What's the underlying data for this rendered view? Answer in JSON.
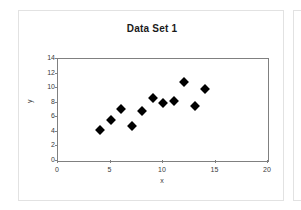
{
  "chart_data": {
    "type": "scatter",
    "title": "Data Set 1",
    "xlabel": "x",
    "ylabel": "y",
    "xlim": [
      0,
      20
    ],
    "ylim": [
      0,
      14
    ],
    "xticks": [
      0,
      5,
      10,
      15,
      20
    ],
    "yticks": [
      0,
      2,
      4,
      6,
      8,
      10,
      12,
      14
    ],
    "grid": false,
    "legend": null,
    "marker": "diamond",
    "marker_color": "#000000",
    "x": [
      4,
      5,
      6,
      7,
      8,
      9,
      10,
      11,
      12,
      13,
      14
    ],
    "y": [
      4.2,
      5.6,
      7.1,
      4.8,
      6.9,
      8.7,
      8.0,
      8.3,
      10.8,
      7.5,
      9.9
    ],
    "points": [
      {
        "x": 4,
        "y": 4.2
      },
      {
        "x": 5,
        "y": 5.6
      },
      {
        "x": 6,
        "y": 7.1
      },
      {
        "x": 7,
        "y": 4.8
      },
      {
        "x": 8,
        "y": 6.9
      },
      {
        "x": 9,
        "y": 8.7
      },
      {
        "x": 10,
        "y": 8.0
      },
      {
        "x": 11,
        "y": 8.3
      },
      {
        "x": 12,
        "y": 10.8
      },
      {
        "x": 13,
        "y": 7.5
      },
      {
        "x": 14,
        "y": 9.9
      }
    ]
  },
  "colors": {
    "panel_border": "#e2e2e2",
    "axis": "#808080",
    "text": "#3a3a3a",
    "title": "#1a1a1a",
    "marker": "#000000",
    "background": "#ffffff"
  }
}
